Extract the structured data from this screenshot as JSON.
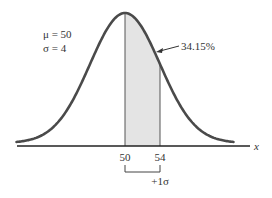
{
  "chart_data": {
    "type": "area",
    "title": "",
    "distribution": "normal",
    "mean": 50,
    "sd": 4,
    "params_text": [
      "μ = 50",
      "σ = 4"
    ],
    "shaded_region": {
      "from": 50,
      "to": 54,
      "area_label": "34.15%"
    },
    "xlabel": "x",
    "ylabel": "",
    "xticks": [
      50,
      54
    ],
    "xtick_labels": [
      "50",
      "54"
    ],
    "bracket_label": "+1σ",
    "xlim": [
      37.6,
      64.8
    ],
    "grid": false,
    "legend": "none"
  },
  "colors": {
    "curve": "#4a4a4a",
    "shade": "#e4e4e4",
    "axis": "#222222",
    "text": "#333333"
  }
}
